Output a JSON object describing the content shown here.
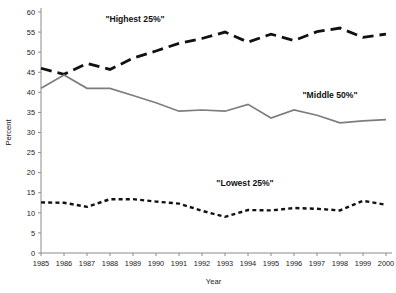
{
  "chart_data": {
    "type": "line",
    "title": "",
    "xlabel": "Year",
    "ylabel": "Percent",
    "grid": false,
    "legend_position": "inline-annotations",
    "x": [
      1985,
      1986,
      1987,
      1988,
      1989,
      1990,
      1991,
      1992,
      1993,
      1994,
      1995,
      1996,
      1997,
      1998,
      1999,
      2000
    ],
    "categories": [
      "1985",
      "1986",
      "1987",
      "1988",
      "1989",
      "1990",
      "1991",
      "1992",
      "1993",
      "1994",
      "1995",
      "1996",
      "1997",
      "1998",
      "1999",
      "2000"
    ],
    "xlim": [
      1985,
      2000
    ],
    "ylim": [
      0,
      60
    ],
    "ytick_labels": [
      "0",
      "5",
      "10",
      "15",
      "20",
      "25",
      "30",
      "35",
      "40",
      "45",
      "50",
      "55",
      "60"
    ],
    "yticks": [
      0,
      5,
      10,
      15,
      20,
      25,
      30,
      35,
      40,
      45,
      50,
      55,
      60
    ],
    "series": [
      {
        "name": "\"Highest 25%\"",
        "style": "long-dashed",
        "color": "#111111",
        "values": [
          46.0,
          44.5,
          47.2,
          45.7,
          48.5,
          50.3,
          52.2,
          53.4,
          55.0,
          52.5,
          54.5,
          52.9,
          55.1,
          56.0,
          53.7,
          54.5
        ]
      },
      {
        "name": "\"Middle 50%\"",
        "style": "solid",
        "color": "#7d7d7d",
        "values": [
          41.0,
          44.3,
          41.0,
          41.0,
          39.2,
          37.4,
          35.3,
          35.6,
          35.3,
          37.0,
          33.6,
          35.6,
          34.3,
          32.4,
          32.9,
          33.2
        ]
      },
      {
        "name": "\"Lowest 25%\"",
        "style": "short-dashed",
        "color": "#111111",
        "values": [
          12.6,
          12.5,
          11.5,
          13.4,
          13.4,
          12.8,
          12.3,
          10.5,
          9.0,
          10.7,
          10.6,
          11.2,
          11.0,
          10.6,
          13.0,
          12.0
        ]
      }
    ],
    "annotations": [
      {
        "text": "\"Highest 25%\"",
        "x_px": 135,
        "y_px": 22
      },
      {
        "text": "\"Middle 50%\"",
        "x_px": 330,
        "y_px": 98
      },
      {
        "text": "\"Lowest 25%\"",
        "x_px": 245,
        "y_px": 186
      }
    ]
  },
  "axes": {
    "y_title": "Percent",
    "x_title": "Year"
  }
}
